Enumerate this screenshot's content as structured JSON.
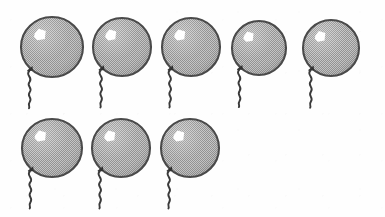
{
  "image": {
    "title": "Counting worksheet illustration — balloons",
    "subject": "balloon",
    "total_count": 8,
    "background_color": "#fefefe",
    "rows": [
      {
        "label": "top-row",
        "count": 5
      },
      {
        "label": "bottom-row",
        "count": 3
      }
    ]
  },
  "style": {
    "outline_color": "#4a4a4a",
    "fill_color": "#a8a8a8",
    "fill_dither_light": "#c2c2c2",
    "fill_dither_dark": "#8f8f8f",
    "highlight_color": "#ffffff",
    "string_color": "#3a3a3a",
    "knot_color": "#333333"
  },
  "balloons": [
    {
      "id": "balloon-1",
      "row": "top-row",
      "index": 1,
      "cx": 52,
      "cy": 47,
      "rx": 31,
      "ry": 30
    },
    {
      "id": "balloon-2",
      "row": "top-row",
      "index": 2,
      "cx": 122,
      "cy": 47,
      "rx": 29,
      "ry": 29
    },
    {
      "id": "balloon-3",
      "row": "top-row",
      "index": 3,
      "cx": 191,
      "cy": 47,
      "rx": 29,
      "ry": 29
    },
    {
      "id": "balloon-4",
      "row": "top-row",
      "index": 4,
      "cx": 259,
      "cy": 48,
      "rx": 27,
      "ry": 27
    },
    {
      "id": "balloon-5",
      "row": "top-row",
      "index": 5,
      "cx": 331,
      "cy": 48,
      "rx": 28,
      "ry": 28
    },
    {
      "id": "balloon-6",
      "row": "bottom-row",
      "index": 6,
      "cx": 52,
      "cy": 148,
      "rx": 30,
      "ry": 29
    },
    {
      "id": "balloon-7",
      "row": "bottom-row",
      "index": 7,
      "cx": 121,
      "cy": 148,
      "rx": 29,
      "ry": 29
    },
    {
      "id": "balloon-8",
      "row": "bottom-row",
      "index": 8,
      "cx": 190,
      "cy": 148,
      "rx": 29,
      "ry": 29
    }
  ]
}
